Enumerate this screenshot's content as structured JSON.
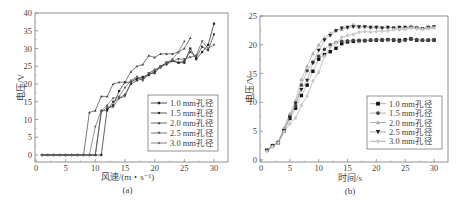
{
  "chart_data": [
    {
      "id": "a",
      "type": "line",
      "caption": "(a)",
      "title": "",
      "xlabel": "风速/(m・s⁻¹)",
      "ylabel": "电压/V",
      "xlim": [
        0,
        32
      ],
      "ylim": [
        -1,
        40
      ],
      "xticks": [
        0,
        5,
        10,
        15,
        20,
        25,
        30
      ],
      "yticks": [
        0,
        5,
        10,
        15,
        20,
        25,
        30,
        35,
        40
      ],
      "grid": false,
      "legend_position": "lower right",
      "series": [
        {
          "name": "1.0 mm孔径",
          "marker": "square",
          "color": "#222222",
          "x": [
            1,
            2,
            3,
            4,
            5,
            6,
            7,
            8,
            9,
            10,
            11,
            12,
            13,
            14,
            15,
            16,
            17,
            18,
            19,
            20,
            21,
            22,
            23,
            24,
            25,
            26,
            27,
            28,
            29,
            30
          ],
          "y": [
            0,
            0,
            0,
            0,
            0,
            0,
            0,
            0,
            0,
            0,
            0,
            13,
            14,
            18,
            20.5,
            20.5,
            21.5,
            22,
            22.5,
            23.5,
            25,
            26,
            26.5,
            26,
            26,
            30,
            27,
            29,
            31,
            37
          ]
        },
        {
          "name": "1.5 mm孔径",
          "marker": "circle",
          "color": "#333333",
          "x": [
            1,
            2,
            3,
            4,
            5,
            6,
            7,
            8,
            9,
            10,
            11,
            12,
            13,
            14,
            15,
            16,
            17,
            18,
            19,
            20,
            21,
            22,
            23,
            24,
            25,
            26,
            27,
            28,
            29,
            30
          ],
          "y": [
            0,
            0,
            0,
            0,
            0,
            0,
            0,
            0,
            0,
            0,
            12.5,
            12.5,
            15,
            16,
            17,
            20,
            21,
            21.5,
            23,
            23,
            25,
            25.5,
            26.5,
            26,
            26.5,
            29,
            27.5,
            30.5,
            29.5,
            34
          ]
        },
        {
          "name": "2.0 mm孔径",
          "marker": "triangle-up",
          "color": "#444444",
          "x": [
            1,
            2,
            3,
            4,
            5,
            6,
            7,
            8,
            9,
            10,
            11,
            12,
            13,
            14,
            15,
            16,
            17,
            18,
            19,
            20,
            21,
            22,
            23,
            24,
            25,
            26
          ],
          "y": [
            0,
            0,
            0,
            0,
            0,
            0,
            0,
            0,
            12,
            12.5,
            16.5,
            16.5,
            20,
            20.5,
            20.5,
            23.5,
            25,
            25.5,
            28,
            27.5,
            28.5,
            28.5,
            28.5,
            29,
            30,
            33
          ]
        },
        {
          "name": "2.5 mm孔径",
          "marker": "triangle-down",
          "color": "#555555",
          "x": [
            1,
            2,
            3,
            4,
            5,
            6,
            7,
            8,
            9,
            10,
            11,
            12,
            13,
            14,
            15,
            16,
            17,
            18,
            19,
            20,
            21,
            22,
            23,
            24,
            25,
            26,
            27,
            28,
            29,
            30
          ],
          "y": [
            0,
            0,
            0,
            0,
            0,
            0,
            0,
            0,
            0,
            0,
            12,
            13.5,
            13.5,
            16,
            16.5,
            20.5,
            22,
            21,
            23,
            24,
            24.5,
            26,
            26.5,
            27,
            27,
            27.5,
            28,
            32,
            30,
            31
          ]
        },
        {
          "name": "3.0 mm孔径",
          "marker": "diamond",
          "color": "#666666",
          "x": [
            1,
            2,
            3,
            4,
            5,
            6,
            7,
            8,
            9,
            10,
            11,
            12,
            13,
            14,
            15,
            16,
            17,
            18,
            19,
            20,
            21,
            22,
            23,
            24,
            25
          ],
          "y": [
            0,
            0,
            0,
            0,
            0,
            0,
            0,
            0,
            0,
            8,
            12.5,
            14,
            16,
            16.5,
            19,
            21,
            22,
            21,
            23,
            24,
            25,
            26,
            27,
            29,
            32
          ]
        }
      ]
    },
    {
      "id": "b",
      "type": "line",
      "caption": "(b)",
      "title": "",
      "xlabel": "时间/s",
      "ylabel": "电压/V",
      "xlim": [
        0,
        32
      ],
      "ylim": [
        0,
        25
      ],
      "xticks": [
        0,
        5,
        10,
        15,
        20,
        25,
        30
      ],
      "yticks": [
        0,
        5,
        10,
        15,
        20,
        25
      ],
      "grid": false,
      "legend_position": "lower right",
      "series": [
        {
          "name": "1.0 mm孔径",
          "marker": "square",
          "color": "#111111",
          "x": [
            1,
            2,
            3,
            4,
            5,
            6,
            7,
            8,
            9,
            10,
            11,
            12,
            13,
            14,
            15,
            16,
            17,
            18,
            19,
            20,
            21,
            22,
            23,
            24,
            25,
            26,
            27,
            28,
            29,
            30
          ],
          "y": [
            1.7,
            2.5,
            3,
            5,
            7.2,
            9,
            11.2,
            13,
            15.4,
            17.5,
            18.3,
            18.8,
            19.4,
            20.2,
            20.5,
            20.6,
            20.7,
            20.7,
            20.8,
            20.8,
            20.8,
            20.9,
            20.8,
            20.8,
            20.9,
            21,
            20.8,
            20.8,
            20.8,
            20.8
          ]
        },
        {
          "name": "1.5 mm孔径",
          "marker": "circle",
          "color": "#444444",
          "x": [
            1,
            2,
            3,
            4,
            5,
            6,
            7,
            8,
            9,
            10,
            11,
            12,
            13,
            14,
            15,
            16,
            17,
            18,
            19,
            20,
            21,
            22,
            23,
            24,
            25,
            26,
            27,
            28,
            29,
            30
          ],
          "y": [
            1.6,
            2.4,
            3.1,
            5.3,
            7.7,
            9.4,
            13,
            15.5,
            17,
            18,
            19.2,
            20,
            20.4,
            20.6,
            20.7,
            20.8,
            20.8,
            20.8,
            20.8,
            20.9,
            20.9,
            20.9,
            20.9,
            20.6,
            20.8,
            21.1,
            20.9,
            20.8,
            20.8,
            20.9
          ]
        },
        {
          "name": "2.0 mm孔径",
          "marker": "triangle-up",
          "color": "#aaaaaa",
          "x": [
            1,
            2,
            3,
            4,
            5,
            6,
            7,
            8,
            9,
            10,
            11,
            12,
            13,
            14,
            15,
            16,
            17,
            18,
            19,
            20,
            21,
            22,
            23,
            24,
            25,
            26,
            27,
            28,
            29,
            30
          ],
          "y": [
            1.7,
            2.5,
            3.2,
            5.6,
            8,
            10.3,
            14,
            16.3,
            18.5,
            20,
            21.2,
            22,
            22.5,
            22.7,
            23,
            23.5,
            23.1,
            23.2,
            23,
            23.1,
            23,
            23,
            23,
            22.9,
            23,
            23.2,
            23.1,
            22.8,
            23,
            23.1
          ]
        },
        {
          "name": "2.5 mm孔径",
          "marker": "triangle-down",
          "color": "#222222",
          "x": [
            1,
            2,
            3,
            4,
            5,
            6,
            7,
            8,
            9,
            10,
            11,
            12,
            13,
            14,
            15,
            16,
            17,
            18,
            19,
            20,
            21,
            22,
            23,
            24,
            25,
            26,
            27,
            28,
            29,
            30
          ],
          "y": [
            1.6,
            2.5,
            3,
            5.1,
            7.4,
            9.8,
            12.2,
            13.8,
            16.8,
            19,
            20.8,
            21.6,
            22.4,
            22.9,
            23,
            23.1,
            23.1,
            23.1,
            23,
            23,
            22.9,
            23,
            22.9,
            23,
            23,
            23,
            22.9,
            22.8,
            23,
            23.1
          ]
        },
        {
          "name": "3.0 mm孔径",
          "marker": "diamond",
          "color": "#c8c8c8",
          "x": [
            1,
            2,
            3,
            4,
            5,
            6,
            7,
            8,
            9,
            10,
            11,
            12,
            13,
            14,
            15,
            16,
            17,
            18,
            19,
            20,
            21,
            22,
            23,
            24,
            25,
            26,
            27,
            28,
            29,
            30
          ],
          "y": [
            1.5,
            2.3,
            3,
            4.9,
            6.3,
            7.3,
            9.5,
            11.1,
            13.7,
            15.2,
            18,
            19.5,
            20.3,
            21.3,
            21.6,
            21.8,
            22.2,
            22.3,
            22.2,
            22.3,
            22.4,
            22.4,
            22.6,
            22.6,
            22.7,
            22.9,
            22.8,
            22.7,
            22.8,
            22.9
          ]
        }
      ]
    }
  ]
}
